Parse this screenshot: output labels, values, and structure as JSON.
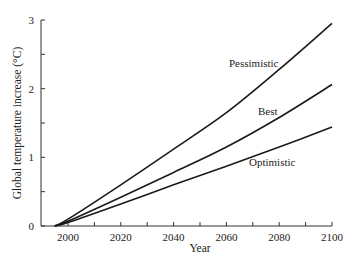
{
  "chart_data": {
    "type": "line",
    "title": "",
    "xlabel": "Year",
    "ylabel": "Global temperature increase (°C)",
    "xlim": [
      1990,
      2100
    ],
    "ylim": [
      0,
      3
    ],
    "x_ticks": [
      2000,
      2020,
      2040,
      2060,
      2080,
      2100
    ],
    "y_ticks": [
      0,
      1,
      2,
      3
    ],
    "grid": false,
    "legend": "inline labels",
    "x": [
      1995,
      2000,
      2020,
      2040,
      2060,
      2080,
      2100
    ],
    "series": [
      {
        "name": "Pessimistic",
        "values": [
          0,
          0.1,
          0.6,
          1.12,
          1.65,
          2.28,
          2.95
        ]
      },
      {
        "name": "Best",
        "values": [
          0,
          0.07,
          0.42,
          0.78,
          1.15,
          1.58,
          2.06
        ]
      },
      {
        "name": "Optimistic",
        "values": [
          0,
          0.05,
          0.32,
          0.6,
          0.87,
          1.15,
          1.44
        ]
      }
    ]
  },
  "labels": {
    "xlabel": "Year",
    "ylabel": "Global temperature increase (°C)",
    "y_tick_labels": [
      "0",
      "1",
      "2",
      "3"
    ],
    "x_tick_labels": [
      "2000",
      "2020",
      "2040",
      "2060",
      "2080",
      "2100"
    ],
    "series_labels": [
      "Pessimistic",
      "Best",
      "Optimistic"
    ]
  }
}
